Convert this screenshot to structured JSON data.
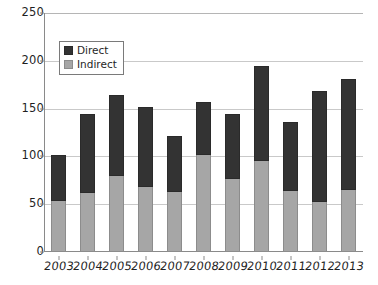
{
  "chart_data": {
    "type": "bar",
    "subtype": "stacked-vertical",
    "title": "",
    "xlabel": "",
    "ylabel": "",
    "ylim": [
      0,
      250
    ],
    "yticks": [
      0,
      50,
      100,
      150,
      200,
      250
    ],
    "ytick_labels": [
      "0",
      "50",
      "100",
      "150",
      "200",
      "250"
    ],
    "grid": "horizontal",
    "legend_position": "upper-left-inside",
    "categories": [
      "2003",
      "2004",
      "2005",
      "2006",
      "2007",
      "2008",
      "2009",
      "2010",
      "2011",
      "2012",
      "2013"
    ],
    "series": [
      {
        "name": "Indirect",
        "color": "#a6a6a6",
        "values": [
          53,
          62,
          79,
          68,
          63,
          101,
          76,
          95,
          64,
          52,
          65
        ]
      },
      {
        "name": "Direct",
        "color": "#333333",
        "values": [
          49,
          82,
          85,
          84,
          58,
          56,
          68,
          100,
          72,
          116,
          116
        ]
      }
    ],
    "totals": [
      102,
      144,
      164,
      152,
      121,
      157,
      144,
      195,
      136,
      168,
      181
    ],
    "stack_order_bottom_to_top": [
      "Indirect",
      "Direct"
    ]
  },
  "legend": {
    "items": [
      {
        "label": "Direct",
        "color": "#333333"
      },
      {
        "label": "Indirect",
        "color": "#a6a6a6"
      }
    ]
  },
  "colors": {
    "direct": "#333333",
    "indirect": "#a6a6a6",
    "axis": "#8a8a8a",
    "grid": "#c9c9c9",
    "background": "#ffffff",
    "text": "#1f1f1f"
  }
}
